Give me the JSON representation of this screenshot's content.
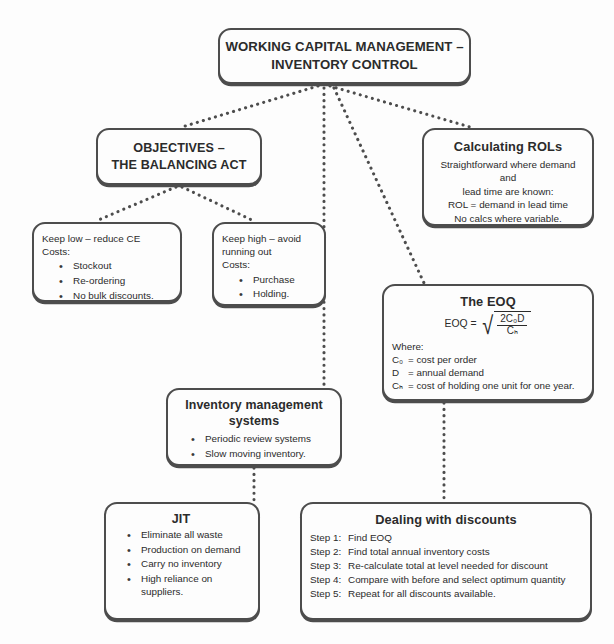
{
  "diagram": {
    "line_color": "#4d4d4d",
    "text_color": "#2b2b2b",
    "background": "#fdfdfd"
  },
  "root": {
    "line1": "WORKING CAPITAL MANAGEMENT –",
    "line2": "INVENTORY CONTROL"
  },
  "objectives": {
    "line1": "OBJECTIVES –",
    "line2": "THE BALANCING ACT"
  },
  "rols": {
    "title": "Calculating ROLs",
    "line1": "Straightforward where demand and",
    "line2": "lead time are known:",
    "line3": "ROL = demand in lead time",
    "line4": "No calcs where variable."
  },
  "keep_low": {
    "line1": "Keep low – reduce CE",
    "line2": "Costs:",
    "bullets": [
      "Stockout",
      "Re-ordering",
      "No bulk discounts."
    ]
  },
  "keep_high": {
    "line1": "Keep high – avoid",
    "line2": "running out",
    "line3": "Costs:",
    "bullets": [
      "Purchase",
      "Holding."
    ]
  },
  "eoq": {
    "title": "The EOQ",
    "formula_lhs": "EOQ =",
    "formula_numerator": "2C₀D",
    "formula_denominator": "Cₕ",
    "formula_plain": "EOQ = sqrt( 2 C_O D / C_H )",
    "where_label": "Where:",
    "definitions": [
      {
        "symbol": "C₀",
        "text": "= cost per order"
      },
      {
        "symbol": "D",
        "text": "= annual demand"
      },
      {
        "symbol": "Cₕ",
        "text": "= cost of holding one unit for one year."
      }
    ]
  },
  "ims": {
    "title_line1": "Inventory management",
    "title_line2": "systems",
    "bullets": [
      "Periodic review systems",
      "Slow moving inventory."
    ]
  },
  "jit": {
    "title": "JIT",
    "bullets": [
      "Eliminate all waste",
      "Production on demand",
      "Carry no inventory",
      "High reliance on suppliers."
    ]
  },
  "discounts": {
    "title": "Dealing with discounts",
    "steps": [
      {
        "label": "Step 1:",
        "text": "Find EOQ"
      },
      {
        "label": "Step 2:",
        "text": "Find total annual inventory costs"
      },
      {
        "label": "Step 3:",
        "text": "Re-calculate total at level needed for discount"
      },
      {
        "label": "Step 4:",
        "text": "Compare with before and select optimum quantity"
      },
      {
        "label": "Step 5:",
        "text": "Repeat for all discounts available."
      }
    ]
  }
}
